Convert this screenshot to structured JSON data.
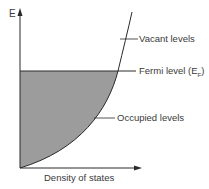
{
  "diagram": {
    "axis_y_label": "E",
    "axis_x_label": "Density of states",
    "labels": {
      "vacant": "Vacant levels",
      "fermi": "Fermi level (E",
      "fermi_sub": "F",
      "fermi_close": ")",
      "occupied": "Occupied levels"
    },
    "colors": {
      "fill": "#9c9c9c",
      "line": "#2a2a2a",
      "text": "#3a3a3a"
    }
  }
}
